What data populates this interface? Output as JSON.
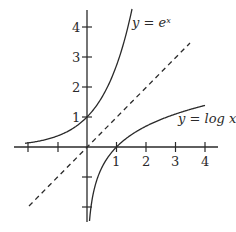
{
  "chart_data": {
    "type": "line",
    "title": "",
    "xlabel": "",
    "ylabel": "",
    "xlim": [
      -2.2,
      4.4
    ],
    "ylim": [
      -2.5,
      4.6
    ],
    "grid": false,
    "legend": "inline labels",
    "x_ticks": [
      -2,
      -1,
      1,
      2,
      3,
      4
    ],
    "x_tick_labels": [
      "1",
      "2",
      "3",
      "4"
    ],
    "y_ticks": [
      -2,
      -1,
      1,
      2,
      3,
      4
    ],
    "y_tick_labels": [
      "1",
      "2",
      "3",
      "4"
    ],
    "series": [
      {
        "name": "y = e^x",
        "label": "y = eˣ",
        "style": "solid",
        "x_range": [
          -2.1,
          1.5
        ]
      },
      {
        "name": "y = log x",
        "label": "y = log x",
        "style": "solid",
        "x_range": [
          0.08,
          4.0
        ]
      },
      {
        "name": "y = x",
        "label": "",
        "style": "dashed",
        "x_range": [
          -2.0,
          3.5
        ]
      }
    ]
  },
  "labels": {
    "exp": "y = eˣ",
    "log": "y = log x",
    "x1": "1",
    "x2": "2",
    "x3": "3",
    "x4": "4",
    "y1": "1",
    "y2": "2",
    "y3": "3",
    "y4": "4"
  },
  "colors": {
    "ink": "#2a2a2a",
    "background": "#ffffff"
  }
}
